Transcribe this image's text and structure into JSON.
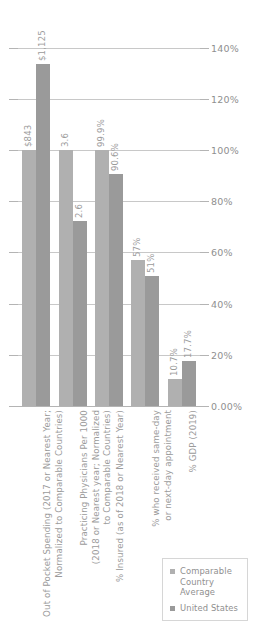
{
  "chart_data": {
    "type": "bar",
    "title": "",
    "subtitle": "",
    "xlabel": "",
    "ylabel": "",
    "ylim": [
      0,
      145
    ],
    "grid": true,
    "legend_position": "bottom-right",
    "categories": [
      "Out of Pocket Spending (2017 or Nearest Year;\nNormalized to Comparable Countries)",
      "Practicing Physicians Per 1000\n(2018 or Nearest year; Normalized\nto Comparable Countries)",
      "% Insured (as of 2018 or Nearest Year)",
      "% who received same-day\nor next-day appointment",
      "% GDP (2019)"
    ],
    "ytick_labels": [
      "0.00%",
      "20%",
      "40%",
      "60%",
      "80%",
      "100%",
      "120%",
      "140%"
    ],
    "ytick_values": [
      0,
      20,
      40,
      60,
      80,
      100,
      120,
      140
    ],
    "series": [
      {
        "name": "Comparable\nCountry Average",
        "color": "#b0b0b0",
        "values": [
          100,
          100,
          100,
          57,
          10.7
        ],
        "labels": [
          "$843",
          "3.6",
          "99.9%",
          "57%",
          "10.7%"
        ]
      },
      {
        "name": "United States",
        "color": "#9a9a9a",
        "values": [
          133.5,
          72.2,
          90.6,
          51,
          17.7
        ],
        "labels": [
          "$1,125",
          "2.6",
          "90.6%",
          "51%",
          "17.7%"
        ]
      }
    ]
  }
}
